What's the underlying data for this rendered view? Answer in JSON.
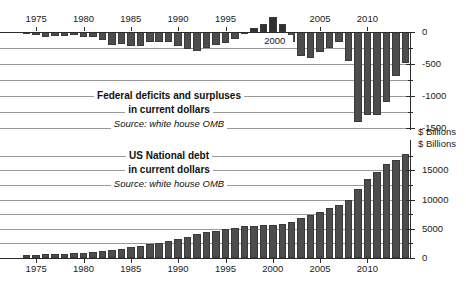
{
  "figure": {
    "width": 466,
    "height": 281,
    "background": "#ffffff",
    "bar_color": "#4d4d4d",
    "grid_color": "#9a9a9a",
    "axis_color": "#2b2b2b"
  },
  "units_top": "$ Billions",
  "units_bottom": "$ Billions",
  "inline_year_marker": "2000",
  "annotations": {
    "top": {
      "line1": "Federal deficits and surpluses",
      "line2": "in current dollars",
      "line3": "Source: white house OMB"
    },
    "bottom": {
      "line1": "US National debt",
      "line2": "in current dollars",
      "line3": "Source: white house OMB"
    }
  },
  "chart_data": [
    {
      "type": "bar",
      "title": "Federal deficits and surpluses in current dollars",
      "subtitle": "Source: white house OMB",
      "xlabel": "",
      "ylabel": "$ Billions",
      "ylim": [
        -1500,
        250
      ],
      "yticks": [
        0,
        -500,
        -1000,
        -1500
      ],
      "ytick_labels": [
        "0",
        "-500",
        "-1000",
        "-1500"
      ],
      "grid": true,
      "grid_step": 250,
      "legend": "none",
      "xticks": [
        1975,
        1980,
        1985,
        1990,
        1995,
        2000,
        2005,
        2010
      ],
      "xtick_labels": [
        "1975",
        "1980",
        "1985",
        "1990",
        "1995",
        "2000",
        "2005",
        "2010"
      ],
      "x": [
        1974,
        1975,
        1976,
        1977,
        1978,
        1979,
        1980,
        1981,
        1982,
        1983,
        1984,
        1985,
        1986,
        1987,
        1988,
        1989,
        1990,
        1991,
        1992,
        1993,
        1994,
        1995,
        1996,
        1997,
        1998,
        1999,
        2000,
        2001,
        2002,
        2003,
        2004,
        2005,
        2006,
        2007,
        2008,
        2009,
        2010,
        2011,
        2012,
        2013,
        2014
      ],
      "values": [
        -6,
        -53,
        -74,
        -54,
        -59,
        -41,
        -74,
        -79,
        -128,
        -208,
        -185,
        -212,
        -221,
        -150,
        -155,
        -153,
        -221,
        -269,
        -290,
        -255,
        -203,
        -164,
        -107,
        -22,
        69,
        126,
        236,
        128,
        -158,
        -378,
        -413,
        -318,
        -248,
        -161,
        -459,
        -1413,
        -1294,
        -1300,
        -1087,
        -680,
        -485
      ]
    },
    {
      "type": "bar",
      "title": "US National debt in current dollars",
      "subtitle": "Source: white house OMB",
      "xlabel": "",
      "ylabel": "$ Billions",
      "ylim": [
        0,
        18500
      ],
      "yticks": [
        0,
        5000,
        10000,
        15000
      ],
      "ytick_labels": [
        "0",
        "5000",
        "10000",
        "15000"
      ],
      "grid": true,
      "grid_step": 2500,
      "legend": "none",
      "xticks": [
        1975,
        1980,
        1985,
        1990,
        1995,
        2000,
        2005,
        2010
      ],
      "xtick_labels": [
        "1975",
        "1980",
        "1985",
        "1990",
        "1995",
        "2000",
        "2005",
        "2010"
      ],
      "x": [
        1974,
        1975,
        1976,
        1977,
        1978,
        1979,
        1980,
        1981,
        1982,
        1983,
        1984,
        1985,
        1986,
        1987,
        1988,
        1989,
        1990,
        1991,
        1992,
        1993,
        1994,
        1995,
        1996,
        1997,
        1998,
        1999,
        2000,
        2001,
        2002,
        2003,
        2004,
        2005,
        2006,
        2007,
        2008,
        2009,
        2010,
        2011,
        2012,
        2013,
        2014
      ],
      "values": [
        475,
        533,
        620,
        699,
        772,
        827,
        908,
        998,
        1142,
        1377,
        1572,
        1823,
        2125,
        2350,
        2602,
        2857,
        3233,
        3665,
        4065,
        4411,
        4693,
        4974,
        5225,
        5413,
        5526,
        5656,
        5674,
        5807,
        6228,
        6783,
        7379,
        7933,
        8507,
        9008,
        10025,
        11910,
        13562,
        14790,
        16066,
        16738,
        17824
      ]
    }
  ]
}
